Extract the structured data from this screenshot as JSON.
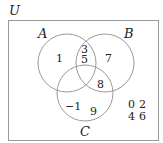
{
  "universe": {
    "label": "U"
  },
  "sets": [
    {
      "id": "A",
      "label": "A"
    },
    {
      "id": "B",
      "label": "B"
    },
    {
      "id": "C",
      "label": "C"
    }
  ],
  "regions": {
    "A_only": [
      "1"
    ],
    "A_and_B_only": [
      "3",
      "5"
    ],
    "B_only": [
      "7"
    ],
    "B_and_C_only": [
      "8"
    ],
    "C_only": [
      "-1",
      "9"
    ],
    "outside": [
      "0",
      "2",
      "4",
      "6"
    ]
  },
  "display": {
    "a_only": "1",
    "ab_1": "3",
    "ab_2": "5",
    "b_only": "7",
    "bc": "8",
    "c_1": "−1",
    "c_2": "9",
    "out_1": "0",
    "out_2": "2",
    "out_3": "4",
    "out_4": "6"
  }
}
